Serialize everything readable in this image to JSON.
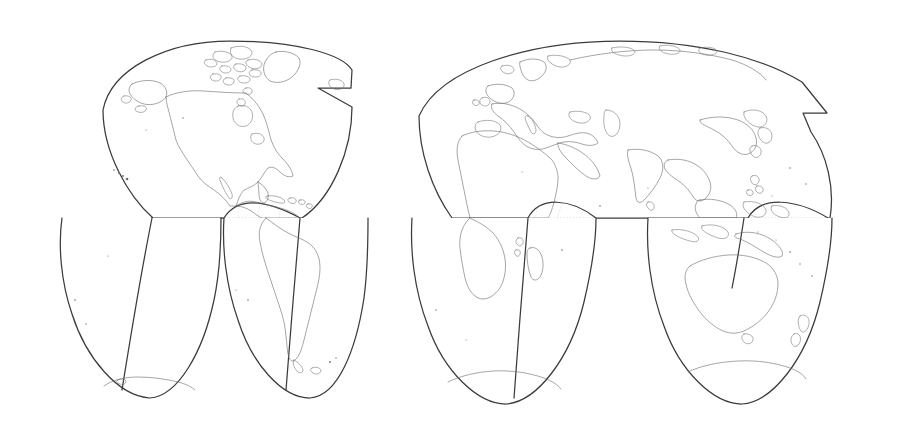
{
  "document": {
    "title": "World Map — Goode Homolosine Interrupted Projection",
    "background_color": "#ffffff",
    "width": 924,
    "height": 436
  },
  "map": {
    "name": "world-outline-map",
    "projection": "Goode Homolosine (interrupted)",
    "type": "vector outline world map",
    "graticule_interval_degrees": 15,
    "colors": {
      "background": "#ffffff",
      "land_fill": "#ffffff",
      "coastline": "#6e6e74",
      "lobe_outline": "#3b3b3e",
      "graticule_minor": "#e9e9ec",
      "graticule_major": "#d9d9de",
      "graticule_special": "#bdbdc4"
    },
    "extent": {
      "left_px": 62,
      "right_px": 876,
      "top_px": 41,
      "bottom_px": 404,
      "equator_y_px": 218
    },
    "lobes": [
      {
        "id": "lobe-americas-north",
        "label": "Western Hemisphere — North",
        "central_meridian": -100,
        "hemisphere": "north",
        "regions": [
          "North America",
          "Greenland",
          "Central America",
          "Caribbean"
        ]
      },
      {
        "id": "lobe-afroeurasia-north",
        "label": "Eastern Hemisphere — North",
        "central_meridian": 30,
        "hemisphere": "north",
        "regions": [
          "Europe",
          "Africa (north)",
          "Middle East",
          "Asia",
          "Southeast Asia"
        ]
      },
      {
        "id": "lobe-south-america",
        "label": "South America lobe",
        "central_meridian": -60,
        "hemisphere": "south",
        "regions": [
          "South America",
          "Antarctic Peninsula edge"
        ]
      },
      {
        "id": "lobe-south-pacific",
        "label": "South Pacific lobe",
        "central_meridian": -160,
        "hemisphere": "south",
        "regions": [
          "Pacific Ocean",
          "Antarctica (Ross sector)"
        ]
      },
      {
        "id": "lobe-africa-south",
        "label": "Southern Africa lobe",
        "central_meridian": 20,
        "hemisphere": "south",
        "regions": [
          "Southern Africa",
          "Madagascar",
          "Antarctica (Atlantic sector)"
        ]
      },
      {
        "id": "lobe-australia",
        "label": "Australia / Oceania lobe",
        "central_meridian": 140,
        "hemisphere": "south",
        "regions": [
          "Australia",
          "New Zealand",
          "Indonesia",
          "New Guinea",
          "Antarctica (Indian sector)"
        ]
      }
    ],
    "features": {
      "north_atlantic_notch": true,
      "north_pacific_notch": true,
      "antarctica_drawn": true,
      "labels_visible": false,
      "axis_ticks_visible": false,
      "legend_visible": false,
      "title_visible": false
    },
    "graticule": {
      "parallels_degrees": [
        75,
        60,
        45,
        30,
        15,
        0,
        -15,
        -30,
        -45,
        -60,
        -75
      ],
      "meridian_spacing_degrees": 15,
      "equator_style": "dotted",
      "tropics_style": "dotted",
      "grid_on": true
    }
  }
}
